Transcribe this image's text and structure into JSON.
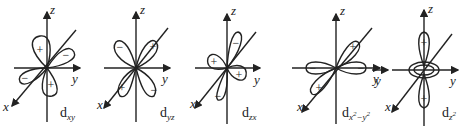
{
  "diagram": {
    "stroke_color": "#222222",
    "orbitals": [
      {
        "id": "dxy",
        "name": "d",
        "subscript": "xy",
        "axes": {
          "z": "z",
          "y": "y",
          "x": "x"
        },
        "signs": [
          "+",
          "−",
          "−",
          "+"
        ]
      },
      {
        "id": "dyz",
        "name": "d",
        "subscript": "yz",
        "axes": {
          "z": "z",
          "y": "y",
          "x": "x"
        },
        "signs": [
          "−",
          "+",
          "+",
          "−"
        ]
      },
      {
        "id": "dzx",
        "name": "d",
        "subscript": "zx",
        "axes": {
          "z": "z",
          "y": "y",
          "x": "x"
        },
        "signs": [
          "−",
          "+",
          "+",
          "−"
        ]
      },
      {
        "id": "dx2y2",
        "name": "d",
        "subscript_base_1": "x",
        "subscript_exp_1": "2",
        "subscript_mid": "−y",
        "subscript_exp_2": "2",
        "axes": {
          "z": "z",
          "y": "y",
          "x": "x",
          "y_left": "y"
        },
        "signs": [
          "+",
          "−",
          "−",
          "+"
        ]
      },
      {
        "id": "dz2",
        "name": "d",
        "subscript_base": "z",
        "subscript_exp": "2",
        "axes": {
          "z": "z",
          "y": "y",
          "x": "x"
        },
        "signs": [
          "+",
          "+"
        ]
      }
    ]
  }
}
